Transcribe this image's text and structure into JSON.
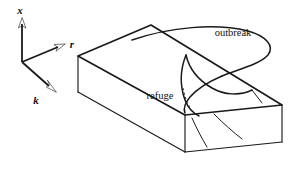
{
  "figure": {
    "background_color": "#ffffff",
    "line_color": "#1a1a1a",
    "width": 295,
    "height": 182
  },
  "axes": {
    "origin": {
      "x": 22,
      "y": 62
    },
    "items": [
      {
        "name": "x",
        "label": "x",
        "direction": "up",
        "label_x": 20,
        "label_y": 14,
        "tip_x": 22,
        "tip_y": 20
      },
      {
        "name": "r",
        "label": "r",
        "direction": "right-up",
        "label_x": 72,
        "label_y": 48,
        "tip_x": 63,
        "tip_y": 47
      },
      {
        "name": "k",
        "label": "k",
        "direction": "down-right",
        "label_x": 36,
        "label_y": 104,
        "tip_x": 54,
        "tip_y": 91
      }
    ]
  },
  "labels": [
    {
      "name": "outbreak",
      "text": "outbreak",
      "x": 233,
      "y": 36
    },
    {
      "name": "refuge",
      "text": "refuge",
      "x": 160,
      "y": 99
    }
  ],
  "surface": {
    "name": "cusp-fold-surface",
    "description": "folded manifold over a parameter plane with a cusp point",
    "regions": [
      "refuge",
      "outbreak"
    ]
  },
  "colors": {
    "stroke": "#1a1a1a",
    "dashed": "#333333",
    "background": "#ffffff"
  }
}
